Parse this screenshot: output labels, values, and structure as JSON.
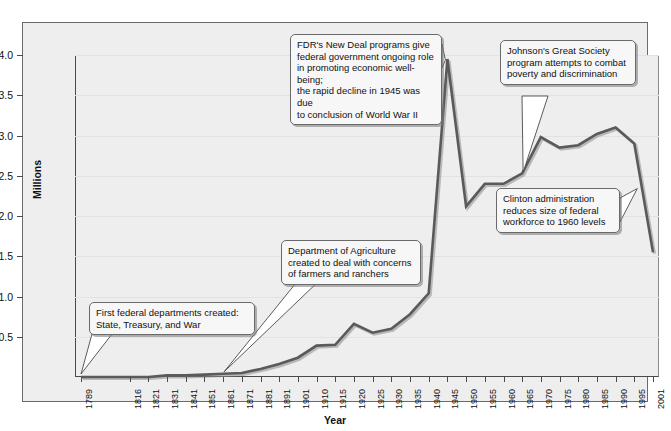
{
  "chart_data": {
    "type": "line",
    "title": "",
    "xlabel": "Year",
    "ylabel": "Millions",
    "ylim": [
      0,
      4.0
    ],
    "y_ticks": [
      "0.5",
      "1.0",
      "1.5",
      "2.0",
      "2.5",
      "3.0",
      "3.5",
      "4.0"
    ],
    "y_tick_values": [
      0.5,
      1.0,
      1.5,
      2.0,
      2.5,
      3.0,
      3.5,
      4.0
    ],
    "grid": true,
    "legend": "none",
    "x_tick_labels": [
      "1789",
      "1816",
      "1821",
      "1831",
      "1841",
      "1851",
      "1861",
      "1871",
      "1881",
      "1891",
      "1901",
      "1910",
      "1915",
      "1920",
      "1925",
      "1930",
      "1935",
      "1940",
      "1945",
      "1950",
      "1955",
      "1960",
      "1965",
      "1970",
      "1975",
      "1980",
      "1985",
      "1990",
      "1995",
      "2001"
    ],
    "x": [
      1789,
      1816,
      1821,
      1831,
      1841,
      1851,
      1861,
      1871,
      1881,
      1891,
      1901,
      1910,
      1915,
      1920,
      1925,
      1930,
      1935,
      1940,
      1945,
      1950,
      1955,
      1960,
      1965,
      1970,
      1975,
      1980,
      1985,
      1990,
      1995,
      2001
    ],
    "values": [
      0.0,
      0.0,
      0.0,
      0.02,
      0.02,
      0.03,
      0.04,
      0.05,
      0.1,
      0.16,
      0.24,
      0.39,
      0.4,
      0.66,
      0.55,
      0.6,
      0.78,
      1.04,
      3.95,
      2.12,
      2.4,
      2.4,
      2.53,
      2.98,
      2.85,
      2.88,
      3.02,
      3.1,
      2.9,
      1.55
    ]
  },
  "annotations": [
    {
      "id": "first-departments",
      "lines": [
        "First federal departments created:",
        "State, Treasury, and War"
      ]
    },
    {
      "id": "agriculture",
      "lines": [
        "Department of Agriculture",
        "created to deal with concerns",
        "of farmers and ranchers"
      ]
    },
    {
      "id": "new-deal",
      "lines": [
        "FDR's New Deal programs give",
        "federal government ongoing role",
        "in promoting economic well-being;",
        "the rapid decline in 1945 was due",
        "to conclusion of World War II"
      ]
    },
    {
      "id": "great-society",
      "lines": [
        "Johnson's Great Society",
        "program attempts to combat",
        "poverty and discrimination"
      ]
    },
    {
      "id": "clinton",
      "lines": [
        "Clinton administration",
        "reduces size of federal",
        "workforce to 1960 levels"
      ]
    }
  ],
  "colors": {
    "line": "#5a5a5a",
    "panel_bg": "#eeeeee",
    "grid": "#e2e2e2",
    "axis": "#4a4a4a",
    "callout_bg": "#f7f7f7",
    "callout_border": "#6a6a6a",
    "text": "#111111"
  }
}
